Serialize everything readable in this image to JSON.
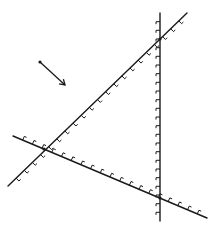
{
  "diagram": {
    "colors": {
      "ink": "#1a1a1a",
      "background": "#ffffff"
    },
    "lines": [
      {
        "name": "ascending-constraint",
        "x1": 8,
        "y1": 186,
        "x2": 187,
        "y2": 13,
        "hatch_side": 1,
        "hatch_count": 22
      },
      {
        "name": "vertical-constraint",
        "x1": 160,
        "y1": 13,
        "x2": 160,
        "y2": 221,
        "hatch_side": 1,
        "hatch_count": 24
      },
      {
        "name": "descending-constraint",
        "x1": 13,
        "y1": 136,
        "x2": 207,
        "y2": 218,
        "hatch_side": -1,
        "hatch_count": 20
      }
    ],
    "intersections": [
      {
        "x": 160,
        "y": 39
      },
      {
        "x": 44,
        "y": 149
      },
      {
        "x": 160,
        "y": 198
      }
    ],
    "arrow": {
      "x1": 40,
      "y1": 62,
      "x2": 65,
      "y2": 85
    }
  }
}
